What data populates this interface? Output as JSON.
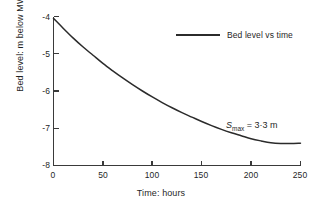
{
  "chart_data": {
    "type": "line",
    "title": "",
    "xlabel": "Time: hours",
    "ylabel": "Bed level: m below MWL",
    "xlim": [
      0,
      250
    ],
    "ylim": [
      -8,
      -4
    ],
    "grid": false,
    "legend_position": "top-right",
    "xticks": [
      0,
      50,
      100,
      150,
      200,
      250
    ],
    "xtick_labels": [
      "0",
      "50",
      "100",
      "150",
      "200",
      "250"
    ],
    "yticks": [
      -4,
      -5,
      -6,
      -7,
      -8
    ],
    "ytick_labels": [
      "-4",
      "-5",
      "-6",
      "-7",
      "-8"
    ],
    "series": [
      {
        "name": "Bed level vs time",
        "color": "#2b2b2b",
        "x": [
          0,
          10,
          20,
          30,
          40,
          50,
          60,
          70,
          80,
          90,
          100,
          110,
          120,
          130,
          140,
          150,
          160,
          170,
          180,
          190,
          200,
          210,
          220,
          230,
          240,
          250
        ],
        "y": [
          -4.05,
          -4.32,
          -4.58,
          -4.82,
          -5.04,
          -5.26,
          -5.46,
          -5.65,
          -5.83,
          -6.0,
          -6.16,
          -6.31,
          -6.45,
          -6.58,
          -6.7,
          -6.82,
          -6.93,
          -7.03,
          -7.12,
          -7.2,
          -7.28,
          -7.34,
          -7.39,
          -7.41,
          -7.41,
          -7.4
        ]
      }
    ],
    "annotations": [
      {
        "name": "max-scour-depth",
        "symbol": "S",
        "subscript": "max",
        "equals": " = 3·3 m",
        "full_text": "Smax = 3·3 m",
        "x": 205,
        "y": -7.1
      }
    ],
    "legend_entries": [
      "Bed level vs time"
    ]
  }
}
